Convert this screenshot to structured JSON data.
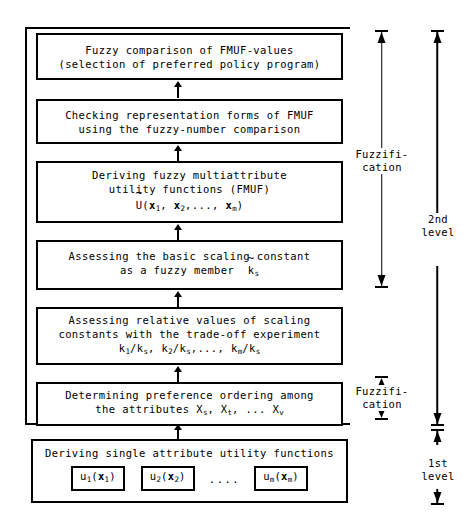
{
  "diagram": {
    "boxes": [
      {
        "id": "box-fuzzy-comparison",
        "lines": [
          "Fuzzy comparison of FMUF-values",
          "(selection of preferred policy program)"
        ]
      },
      {
        "id": "box-checking-representation",
        "lines": [
          "Checking representation forms of FMUF",
          "using the fuzzy-number comparison"
        ]
      },
      {
        "id": "box-deriving-fmuf",
        "lines": [
          "Deriving fuzzy multiattribute",
          "utility functions (FMUF)"
        ],
        "formula": "U~(x1, x2,..., xm)"
      },
      {
        "id": "box-basic-scaling-constant",
        "lines": [
          "Assessing the basic scaling constant",
          "as a fuzzy member  k~s"
        ]
      },
      {
        "id": "box-relative-values",
        "lines": [
          "Assessing relative values of scaling",
          "constants with the trade-off experiment"
        ],
        "formula": "k1/ks, k2/ks,..., km/ks"
      },
      {
        "id": "box-preference-ordering",
        "lines": [
          "Determining preference ordering among",
          "the attributes Xs, Xt, ... Xv"
        ]
      },
      {
        "id": "box-single-attribute",
        "lines": [
          "Deriving single attribute utility functions"
        ],
        "sub_boxes": [
          "u1(x1)",
          "u2(x2)",
          "um(xm)"
        ],
        "sub_boxes_separator": "...."
      }
    ],
    "measures": [
      {
        "id": "measure-fuzzification-upper",
        "label_line1": "Fuzzifi-",
        "label_line2": "cation"
      },
      {
        "id": "measure-fuzzification-lower",
        "label_line1": "Fuzzifi-",
        "label_line2": "cation"
      },
      {
        "id": "measure-second-level",
        "label_line1": "2nd",
        "label_line2": "level"
      },
      {
        "id": "measure-first-level",
        "label_line1": "1st",
        "label_line2": "level"
      }
    ],
    "colors": {
      "stroke": "#000000",
      "background": "#ffffff"
    }
  }
}
